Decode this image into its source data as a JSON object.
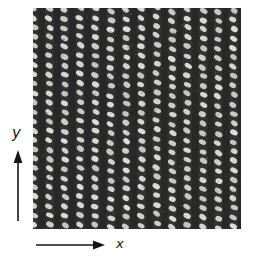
{
  "figure": {
    "type": "micrograph-figure",
    "page_background": "#ffffff"
  },
  "axes": {
    "x_label": "x",
    "y_label": "y",
    "arrow_color": "#151515",
    "label_color": "#151515"
  },
  "pattern": {
    "columns": 14,
    "rows": 24,
    "col_spacing": 15.35,
    "row_spacing": 9.4,
    "origin_x": 1,
    "origin_y": 1.5,
    "dot_rx": 3.7,
    "dot_ry": 2.55,
    "dot_angle_deg": 28,
    "dot_color": "#dcdcd6",
    "background_color": "#282828",
    "noise_specks": 420
  }
}
